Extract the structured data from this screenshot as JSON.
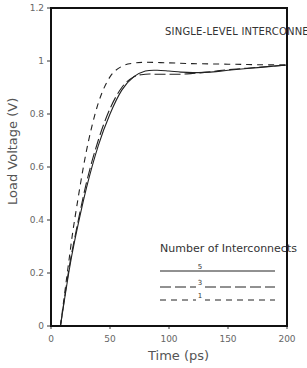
{
  "chart_data": {
    "type": "line",
    "title": "SINGLE-LEVEL INTERCONNECTIONS",
    "xlabel": "Time (ps)",
    "ylabel": "Load Voltage (V)",
    "xlim": [
      0,
      200
    ],
    "ylim": [
      0,
      1.2
    ],
    "xticks": [
      0,
      50,
      100,
      150,
      200
    ],
    "xtick_labels": [
      "0",
      "50",
      "100",
      "150",
      "200"
    ],
    "yticks": [
      0,
      0.2,
      0.4,
      0.6,
      0.8,
      1,
      1.2
    ],
    "ytick_labels": [
      "0",
      "0.2",
      "0.4",
      "0.6",
      "0.8",
      "1",
      "1.2"
    ],
    "grid": false,
    "legend": {
      "title": "Number of Interconnects",
      "position": "lower right",
      "entries": [
        {
          "label": "5",
          "style": "solid"
        },
        {
          "label": "3",
          "style": "long-dash"
        },
        {
          "label": "1",
          "style": "short-dash"
        }
      ]
    },
    "series": [
      {
        "name": "5",
        "style": "solid",
        "x": [
          8,
          15,
          20,
          30,
          40,
          50,
          60,
          70,
          80,
          90,
          100,
          110,
          120,
          130,
          140,
          150,
          175,
          200
        ],
        "y": [
          0,
          0.2,
          0.32,
          0.52,
          0.68,
          0.8,
          0.89,
          0.94,
          0.962,
          0.965,
          0.962,
          0.958,
          0.956,
          0.957,
          0.96,
          0.965,
          0.975,
          0.985
        ]
      },
      {
        "name": "3",
        "style": "long-dash",
        "x": [
          8,
          15,
          20,
          30,
          40,
          50,
          60,
          70,
          80,
          90,
          100,
          110,
          120,
          130,
          140,
          150,
          175,
          200
        ],
        "y": [
          0,
          0.21,
          0.33,
          0.54,
          0.7,
          0.82,
          0.9,
          0.94,
          0.95,
          0.95,
          0.95,
          0.95,
          0.953,
          0.957,
          0.962,
          0.967,
          0.976,
          0.985
        ]
      },
      {
        "name": "1",
        "style": "short-dash",
        "x": [
          8,
          15,
          20,
          30,
          40,
          50,
          60,
          70,
          80,
          100,
          120,
          150,
          175,
          200
        ],
        "y": [
          0,
          0.24,
          0.4,
          0.66,
          0.84,
          0.94,
          0.98,
          0.992,
          0.995,
          0.993,
          0.99,
          0.988,
          0.986,
          0.985
        ]
      }
    ]
  }
}
